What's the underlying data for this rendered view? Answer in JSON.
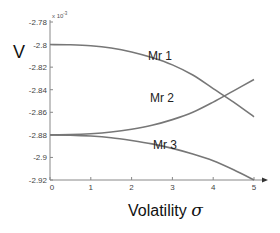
{
  "chart_data": {
    "type": "line",
    "title": "",
    "xlabel": "Volatility σ",
    "ylabel": "V",
    "y_exponent_label": "x 10",
    "y_exponent_power": "-3",
    "xlim": [
      0,
      5
    ],
    "ylim": [
      -2.92,
      -2.78
    ],
    "x_ticks": [
      "0",
      "1",
      "2",
      "3",
      "4",
      "5"
    ],
    "y_ticks": [
      "-2.78",
      "-2.8",
      "-2.82",
      "-2.84",
      "-2.86",
      "-2.88",
      "-2.9",
      "-2.92"
    ],
    "grid": false,
    "legend": "inline labels",
    "x": [
      0,
      0.5,
      1,
      1.5,
      2,
      2.5,
      3,
      3.5,
      4,
      4.5,
      5
    ],
    "series": [
      {
        "name": "Mr 1",
        "values": [
          -2.8,
          -2.8002,
          -2.801,
          -2.803,
          -2.8065,
          -2.8115,
          -2.818,
          -2.827,
          -2.839,
          -2.851,
          -2.864
        ]
      },
      {
        "name": "Mr 2",
        "values": [
          -2.88,
          -2.8798,
          -2.879,
          -2.8775,
          -2.875,
          -2.8715,
          -2.8665,
          -2.86,
          -2.851,
          -2.841,
          -2.831
        ]
      },
      {
        "name": "Mr 3",
        "values": [
          -2.88,
          -2.8802,
          -2.881,
          -2.8825,
          -2.885,
          -2.888,
          -2.892,
          -2.897,
          -2.903,
          -2.911,
          -2.92
        ]
      }
    ],
    "line_color": "#777777"
  }
}
